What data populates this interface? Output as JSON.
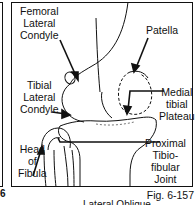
{
  "figure": {
    "number": "Fig. 6-157",
    "previous_figure_fragment": "6",
    "caption_partial": "Lateral Oblique"
  },
  "labels": {
    "femoral_lateral_condyle": [
      "Femoral",
      "Lateral",
      "Condyle"
    ],
    "patella": [
      "Patella"
    ],
    "tibial_lateral_condyle": [
      "Tibial",
      "Lateral",
      "Condyle"
    ],
    "medial_tibial_plateau": [
      "Medial",
      "tibial",
      "Plateau"
    ],
    "head_of_fibula": [
      "Head",
      "of",
      "Fibula"
    ],
    "proximal_tibiofibular_joint": [
      "Proximal",
      "Tibio-",
      "fibular",
      "Joint"
    ]
  },
  "colors": {
    "ink": "#111111",
    "background": "#ffffff"
  }
}
